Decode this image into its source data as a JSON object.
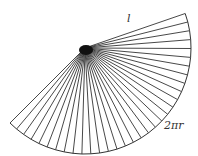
{
  "diagram": {
    "apex": {
      "x": 85,
      "y": 48
    },
    "radius": 106,
    "start_angle_deg": -19,
    "end_angle_deg": 135,
    "segments": 32,
    "stroke_color": "#333333",
    "labels": {
      "slant": "l",
      "arc": "2πr"
    }
  }
}
